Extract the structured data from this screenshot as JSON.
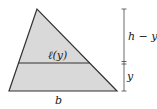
{
  "diagram": {
    "type": "triangle-cross-section",
    "colors": {
      "fill": "#d9d9d9",
      "stroke": "#333333",
      "background": "#ffffff"
    },
    "labels": {
      "cross_section": "ℓ(y)",
      "base": "b",
      "upper_height": "h − y",
      "lower_height": "y"
    }
  }
}
